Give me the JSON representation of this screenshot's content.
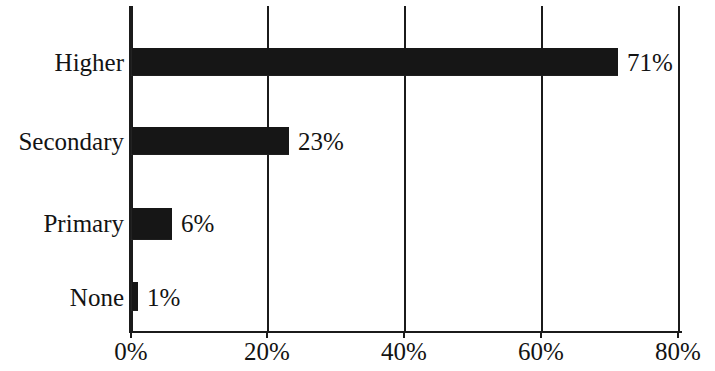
{
  "chart_data": {
    "type": "bar",
    "orientation": "horizontal",
    "title": "",
    "subtitle": "",
    "xlabel": "",
    "ylabel": "",
    "categories": [
      "Higher",
      "Secondary",
      "Primary",
      "None"
    ],
    "values": [
      71,
      23,
      6,
      1
    ],
    "value_labels": [
      "71%",
      "23%",
      "6%",
      "1%"
    ],
    "xlim": [
      0,
      80
    ],
    "xticks": [
      0,
      20,
      40,
      60,
      80
    ],
    "xtick_labels": [
      "0%",
      "20%",
      "40%",
      "60%",
      "80%"
    ],
    "grid": "vertical-only",
    "legend": "none",
    "bar_color": "#161616",
    "axis_color": "#1b1b1b",
    "text_color": "#131313",
    "background": "#ffffff",
    "units": "percent",
    "series": [
      {
        "name": "",
        "values": [
          71,
          23,
          6,
          1
        ]
      }
    ]
  }
}
